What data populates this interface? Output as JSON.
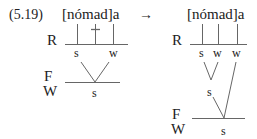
{
  "example_number": "(5.19)",
  "arrow": "→",
  "left": {
    "form": "[nómad]a",
    "tiers": {
      "R": "R",
      "F": "F",
      "W": "W"
    },
    "r_nodes": [
      "s",
      "w"
    ],
    "foot_node": "s"
  },
  "right": {
    "form": "[nómad]a",
    "tiers": {
      "R": "R",
      "F": "F",
      "W": "W"
    },
    "r_nodes": [
      "s",
      "w",
      "w"
    ],
    "mid_node": "s",
    "foot_node": "s"
  },
  "colors": {
    "line": "#666666",
    "text": "#222222"
  }
}
